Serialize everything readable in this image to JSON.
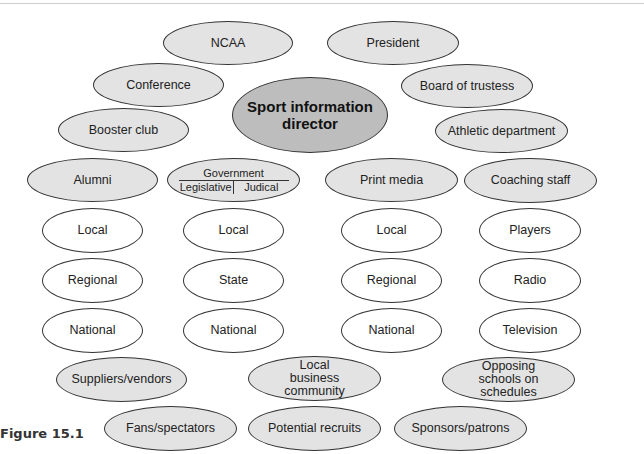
{
  "figure": {
    "caption": "Figure 15.1",
    "center_node": "Sport information director"
  },
  "nodes": {
    "ncaa": "NCAA",
    "president": "President",
    "conference": "Conference",
    "board": "Board of trustess",
    "booster": "Booster club",
    "athletic": "Athletic department",
    "alumni": "Alumni",
    "government": {
      "title": "Government",
      "left": "Legislative",
      "right": "Judical"
    },
    "print_media": "Print media",
    "coaching": "Coaching staff",
    "alumni_sub": [
      "Local",
      "Regional",
      "National"
    ],
    "government_sub": [
      "Local",
      "State",
      "National"
    ],
    "print_sub": [
      "Local",
      "Regional",
      "National"
    ],
    "coaching_sub": [
      "Players",
      "Radio",
      "Television"
    ],
    "suppliers": "Suppliers/vendors",
    "local_business": "Local business community",
    "opposing": "Opposing schools on schedules",
    "fans": "Fans/spectators",
    "recruits": "Potential recruits",
    "sponsors": "Sponsors/patrons"
  },
  "colors": {
    "shaded": "#e3e3e3",
    "center": "#bdbdbd",
    "outline": "#333333"
  }
}
